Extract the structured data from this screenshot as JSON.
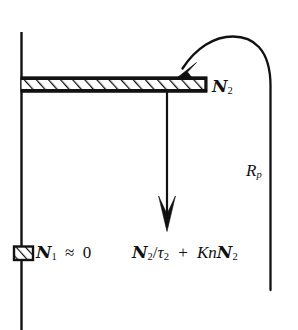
{
  "figure": {
    "type": "energy-level-diagram",
    "background_color": "#ffffff",
    "stroke_color": "#111111",
    "width": 298,
    "height": 330
  },
  "labels": {
    "upper_level": {
      "symbol": "N",
      "subscript": "2",
      "text": "N2"
    },
    "lower_level": {
      "symbol": "N",
      "subscript": "1",
      "relation": "≈",
      "value": "0",
      "text": "N1 ≈ 0"
    },
    "pump_rate": {
      "symbol": "R",
      "subscript": "p",
      "text": "Rp"
    },
    "decay_terms": {
      "term1_numerator": "N",
      "term1_numerator_sub": "2",
      "divider": "/",
      "term1_denominator": "τ",
      "term1_denominator_sub": "2",
      "operator": "+",
      "term2_coefficient": "Kn",
      "term2_symbol": "N",
      "term2_sub": "2",
      "text": "N2/τ2 + KnN2"
    }
  },
  "elements": {
    "axis": {
      "name": "vertical-energy-axis"
    },
    "upper_level_bar": {
      "name": "upper-level-hatched-bar",
      "hatched": true
    },
    "lower_level_box": {
      "name": "lower-level-hatched-box",
      "hatched": true
    },
    "decay_arrow": {
      "name": "downward-decay-arrow"
    },
    "pump_arrow": {
      "name": "curved-pump-arrow"
    }
  }
}
